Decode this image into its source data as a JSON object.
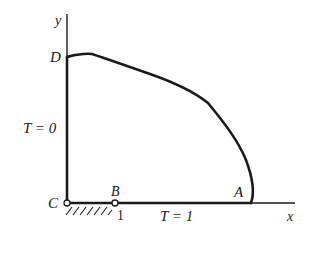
{
  "diagram": {
    "axes": {
      "x_label": "x",
      "y_label": "y"
    },
    "points": {
      "A": "A",
      "B": "B",
      "C": "C",
      "D": "D"
    },
    "boundary_labels": {
      "left": "T = 0",
      "bottom": "T = 1"
    },
    "tick_label_B": "1",
    "colors": {
      "ink": "#1a1a1a",
      "background": "#ffffff"
    }
  }
}
